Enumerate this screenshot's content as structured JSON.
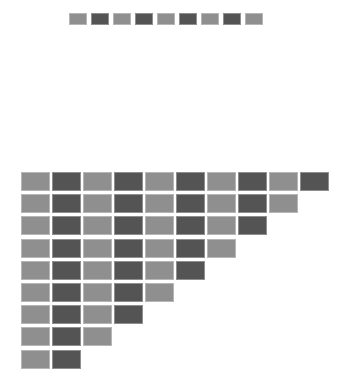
{
  "colors": {
    "light": "#8f8f8f",
    "dark": "#545454",
    "background": "#ffffff"
  },
  "top_row": {
    "count": 9,
    "x": 69,
    "y": 13,
    "tile_width": 18,
    "tile_height": 12,
    "pitch_x": 22,
    "pattern": [
      "light",
      "dark",
      "light",
      "dark",
      "light",
      "dark",
      "light",
      "dark",
      "light"
    ]
  },
  "triangle": {
    "x": 21,
    "y": 172,
    "tile_width": 29,
    "tile_height": 19,
    "pitch_x": 31,
    "pitch_y": 22.2,
    "row_counts": [
      10,
      9,
      8,
      7,
      6,
      5,
      4,
      3,
      2
    ],
    "pattern_start": "light"
  }
}
